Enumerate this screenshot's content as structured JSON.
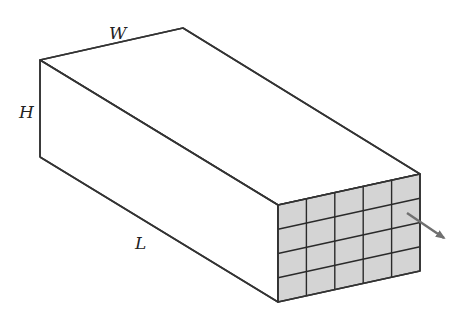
{
  "diagram": {
    "type": "3d-rectangular-box-with-gridded-end-face",
    "labels": {
      "width": "W",
      "height": "H",
      "length": "L"
    },
    "grid": {
      "columns": 5,
      "rows": 4,
      "cell_color": "#d4d4d4"
    },
    "colors": {
      "edge": "#333333",
      "arrow": "#707070",
      "background": "#ffffff"
    },
    "arrow": {
      "direction": "outward-from-front-face"
    }
  }
}
